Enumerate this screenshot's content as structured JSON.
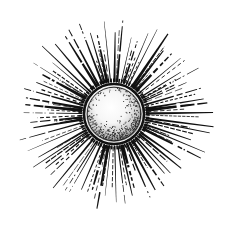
{
  "illustration": {
    "title": "Engraved sun with radiating rays",
    "style": "woodcut / engraving, black ink on white",
    "width": 228,
    "height": 225,
    "background": "#ffffff",
    "ink": "#111111",
    "sun": {
      "center": [
        114,
        114
      ],
      "outer_radius": 30,
      "ring_width": 2.6,
      "inner_ring_radius": 26.8,
      "inner_ring_width": 0.9,
      "highlight_center": [
        110,
        106
      ],
      "highlight_radius": 14,
      "stipple_color": "#1a1a1a",
      "stipple_shadow_side": "lower-right"
    },
    "rays": {
      "count": 64,
      "start_radius": 32,
      "bounds_ellipse": {
        "rx": 101,
        "ry": 97
      },
      "min_length_factor": 0.78,
      "max_width": 3.6,
      "min_width": 0.8,
      "dash_probability": 0.45,
      "seed": 7
    }
  }
}
